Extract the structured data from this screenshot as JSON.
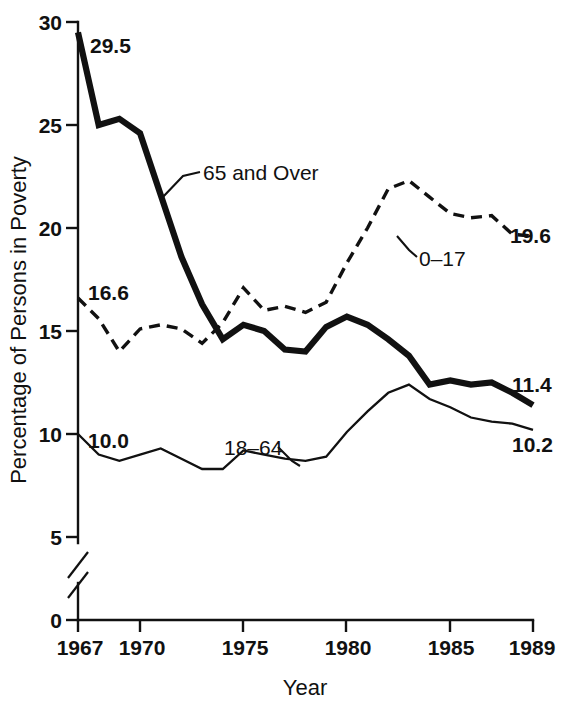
{
  "chart_data": {
    "type": "line",
    "title": "",
    "xlabel": "Year",
    "ylabel": "Percentage of Persons in Poverty",
    "xlim": [
      1967,
      1989
    ],
    "ylim": [
      0,
      30
    ],
    "y_axis_break": true,
    "y_axis_break_between": [
      0,
      5
    ],
    "grid": false,
    "legend": "inline-annotations",
    "x_ticks": [
      "1967",
      "1970",
      "1975",
      "1980",
      "1985",
      "1989"
    ],
    "x_tick_values": [
      1967,
      1970,
      1975,
      1980,
      1985,
      1989
    ],
    "y_ticks": [
      "0",
      "5",
      "10",
      "15",
      "20",
      "25",
      "30"
    ],
    "y_tick_values": [
      0,
      5,
      10,
      15,
      20,
      25,
      30
    ],
    "x": [
      1967,
      1968,
      1969,
      1970,
      1971,
      1972,
      1973,
      1974,
      1975,
      1976,
      1977,
      1978,
      1979,
      1980,
      1981,
      1982,
      1983,
      1984,
      1985,
      1986,
      1987,
      1988,
      1989
    ],
    "series": [
      {
        "name": "65 and Over",
        "style": "thick-solid",
        "values": [
          29.5,
          25.0,
          25.3,
          24.6,
          21.6,
          18.6,
          16.3,
          14.6,
          15.3,
          15.0,
          14.1,
          14.0,
          15.2,
          15.7,
          15.3,
          14.6,
          13.8,
          12.4,
          12.6,
          12.4,
          12.5,
          12.0,
          11.4
        ],
        "start_label": "29.5",
        "end_label": "11.4"
      },
      {
        "name": "0–17",
        "style": "dashed",
        "values": [
          16.6,
          15.6,
          14.0,
          15.1,
          15.3,
          15.1,
          14.4,
          15.4,
          17.1,
          16.0,
          16.2,
          15.9,
          16.4,
          18.3,
          20.0,
          21.9,
          22.3,
          21.5,
          20.7,
          20.5,
          20.6,
          19.7,
          19.6
        ],
        "end_label": "19.6",
        "start_label": "16.6"
      },
      {
        "name": "18–64",
        "style": "thin-solid",
        "values": [
          10.0,
          9.0,
          8.7,
          9.0,
          9.3,
          8.8,
          8.3,
          8.3,
          9.2,
          9.0,
          8.8,
          8.7,
          8.9,
          10.1,
          11.1,
          12.0,
          12.4,
          11.7,
          11.3,
          10.8,
          10.6,
          10.5,
          10.2
        ],
        "start_label": "10.0",
        "end_label": "10.2"
      }
    ],
    "annotations": [
      {
        "text": "65 and Over",
        "points_to_series": "65 and Over"
      },
      {
        "text": "0–17",
        "points_to_series": "0–17"
      },
      {
        "text": "18–64",
        "points_to_series": "18–64"
      }
    ],
    "value_labels": {
      "elderly_start": "29.5",
      "elderly_end": "11.4",
      "children_start": "16.6",
      "children_end": "19.6",
      "adults_start": "10.0",
      "adults_end": "10.2"
    }
  }
}
